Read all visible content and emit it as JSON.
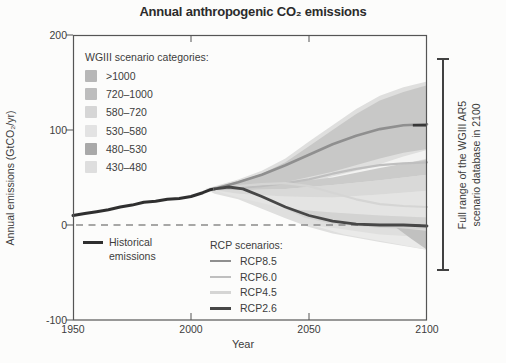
{
  "chart_data": {
    "type": "line",
    "title": "Annual anthropogenic CO₂ emissions",
    "xlabel": "Year",
    "ylabel": "Annual emissions (GtCO₂/yr)",
    "xlim": [
      1950,
      2100
    ],
    "ylim": [
      -100,
      200
    ],
    "xticks": [
      1950,
      2000,
      2050,
      2100
    ],
    "yticks": [
      200,
      100,
      0,
      -100
    ],
    "zero_line": {
      "shown": true,
      "color": "#8a8a8a"
    },
    "axis_color": "#555555",
    "bands": [
      {
        "name": "full-range-fan",
        "color": "#dfdfde",
        "points": [
          [
            2006,
            38
          ],
          [
            2020,
            48
          ],
          [
            2030,
            57
          ],
          [
            2040,
            70
          ],
          [
            2050,
            88
          ],
          [
            2060,
            105
          ],
          [
            2070,
            122
          ],
          [
            2080,
            136
          ],
          [
            2090,
            145
          ],
          [
            2100,
            151
          ],
          [
            2100,
            -26
          ],
          [
            2080,
            -18
          ],
          [
            2060,
            -9
          ],
          [
            2050,
            -2
          ],
          [
            2040,
            7
          ],
          [
            2030,
            17
          ],
          [
            2020,
            27
          ],
          [
            2010,
            33
          ]
        ]
      },
      {
        "name": "upper-high-band",
        "color": "#c8c8c7",
        "points": [
          [
            2008,
            39
          ],
          [
            2020,
            46
          ],
          [
            2030,
            54
          ],
          [
            2040,
            66
          ],
          [
            2050,
            83
          ],
          [
            2060,
            100
          ],
          [
            2070,
            117
          ],
          [
            2080,
            131
          ],
          [
            2090,
            140
          ],
          [
            2100,
            147
          ],
          [
            2100,
            80
          ],
          [
            2090,
            76
          ],
          [
            2080,
            70
          ],
          [
            2060,
            56
          ],
          [
            2040,
            45
          ],
          [
            2020,
            40
          ]
        ]
      },
      {
        "name": "white-sliver",
        "color": "#f3f3f2",
        "points": [
          [
            2058,
            50
          ],
          [
            2075,
            60
          ],
          [
            2090,
            72
          ],
          [
            2100,
            79
          ],
          [
            2100,
            70
          ],
          [
            2090,
            64
          ],
          [
            2075,
            54
          ],
          [
            2060,
            47
          ]
        ]
      },
      {
        "name": "mid-band-rcp60",
        "color": "#cbcbca",
        "points": [
          [
            2008,
            38
          ],
          [
            2020,
            40
          ],
          [
            2040,
            44
          ],
          [
            2060,
            50
          ],
          [
            2080,
            60
          ],
          [
            2100,
            69
          ],
          [
            2100,
            53
          ],
          [
            2080,
            47
          ],
          [
            2060,
            42
          ],
          [
            2040,
            38
          ],
          [
            2020,
            36.5
          ]
        ]
      },
      {
        "name": "mid-band-lower",
        "color": "#d9d9d8",
        "points": [
          [
            2010,
            37
          ],
          [
            2020,
            36.5
          ],
          [
            2040,
            38
          ],
          [
            2060,
            42
          ],
          [
            2080,
            47
          ],
          [
            2100,
            53
          ],
          [
            2100,
            36
          ],
          [
            2080,
            32
          ],
          [
            2060,
            29
          ],
          [
            2040,
            30
          ],
          [
            2020,
            33
          ]
        ]
      },
      {
        "name": "low-band-rcp45",
        "color": "#e4e4e3",
        "points": [
          [
            2010,
            36
          ],
          [
            2020,
            33
          ],
          [
            2040,
            30
          ],
          [
            2060,
            29
          ],
          [
            2080,
            32
          ],
          [
            2100,
            36
          ],
          [
            2100,
            8
          ],
          [
            2080,
            10
          ],
          [
            2060,
            13
          ],
          [
            2040,
            17
          ],
          [
            2030,
            23
          ],
          [
            2020,
            29
          ]
        ]
      },
      {
        "name": "low-band-rcp26",
        "color": "#d3d3d2",
        "points": [
          [
            2040,
            17
          ],
          [
            2060,
            13
          ],
          [
            2080,
            10
          ],
          [
            2100,
            8
          ],
          [
            2100,
            -5
          ],
          [
            2080,
            -3
          ],
          [
            2060,
            1
          ],
          [
            2048,
            8
          ]
        ]
      },
      {
        "name": "below-zero-band",
        "color": "#eaeae9",
        "points": [
          [
            2050,
            0
          ],
          [
            2060,
            -3
          ],
          [
            2080,
            -10
          ],
          [
            2100,
            -13
          ],
          [
            2100,
            -26
          ],
          [
            2085,
            -19
          ],
          [
            2065,
            -10
          ],
          [
            2055,
            -3
          ]
        ]
      },
      {
        "name": "corner-dark-patch",
        "color": "#c1c1c0",
        "points": [
          [
            2087,
            -3
          ],
          [
            2100,
            -6
          ],
          [
            2100,
            -26
          ],
          [
            2093,
            -14
          ]
        ]
      }
    ],
    "series": [
      {
        "name": "Historical emissions",
        "color": "#2f2f2f",
        "width": 3,
        "points": [
          [
            1950,
            10
          ],
          [
            1955,
            12
          ],
          [
            1960,
            14
          ],
          [
            1965,
            16
          ],
          [
            1970,
            19
          ],
          [
            1975,
            21
          ],
          [
            1980,
            24
          ],
          [
            1985,
            25
          ],
          [
            1990,
            27
          ],
          [
            1995,
            28
          ],
          [
            2000,
            30
          ],
          [
            2005,
            34
          ],
          [
            2008,
            37
          ],
          [
            2010,
            38
          ]
        ]
      },
      {
        "name": "RCP8.5",
        "color": "#8f8f8f",
        "width": 2.6,
        "points": [
          [
            2010,
            38
          ],
          [
            2020,
            45
          ],
          [
            2030,
            53
          ],
          [
            2040,
            63
          ],
          [
            2050,
            74
          ],
          [
            2060,
            85
          ],
          [
            2070,
            94
          ],
          [
            2080,
            101
          ],
          [
            2090,
            105
          ],
          [
            2100,
            106
          ]
        ]
      },
      {
        "name": "RCP6.0",
        "color": "#bfbfbf",
        "width": 2.2,
        "points": [
          [
            2010,
            38
          ],
          [
            2020,
            39
          ],
          [
            2030,
            41
          ],
          [
            2040,
            44
          ],
          [
            2050,
            48
          ],
          [
            2060,
            54
          ],
          [
            2070,
            59
          ],
          [
            2080,
            63
          ],
          [
            2090,
            65
          ],
          [
            2100,
            66
          ]
        ]
      },
      {
        "name": "RCP4.5",
        "color": "#d5d5d4",
        "width": 2.2,
        "points": [
          [
            2010,
            38
          ],
          [
            2020,
            41
          ],
          [
            2030,
            43
          ],
          [
            2040,
            44
          ],
          [
            2050,
            41
          ],
          [
            2060,
            34
          ],
          [
            2070,
            27
          ],
          [
            2080,
            22
          ],
          [
            2090,
            20
          ],
          [
            2100,
            19
          ]
        ]
      },
      {
        "name": "RCP2.6",
        "color": "#474747",
        "width": 2.8,
        "points": [
          [
            2010,
            38
          ],
          [
            2016,
            40
          ],
          [
            2022,
            38
          ],
          [
            2030,
            30
          ],
          [
            2040,
            19
          ],
          [
            2050,
            10
          ],
          [
            2060,
            4
          ],
          [
            2070,
            1
          ],
          [
            2080,
            0
          ],
          [
            2090,
            0
          ],
          [
            2100,
            -1
          ]
        ]
      }
    ],
    "end_dash": {
      "value": 105,
      "year_start": 2094,
      "year_end": 2100,
      "color": "#383838"
    }
  },
  "legends": {
    "wgiii": {
      "title": "WGIII scenario categories:",
      "items": [
        {
          "label": ">1000",
          "color": "#b7b7b7"
        },
        {
          "label": "720–1000",
          "color": "#bdbdbd"
        },
        {
          "label": "580–720",
          "color": "#d6d6d6"
        },
        {
          "label": "530–580",
          "color": "#e3e3e3"
        },
        {
          "label": "480–530",
          "color": "#a9a9a9"
        },
        {
          "label": "430–480",
          "color": "#dedede"
        }
      ]
    },
    "historical": {
      "line1": "Historical",
      "line2": "emissions",
      "color": "#2f2f2f"
    },
    "rcp": {
      "title": "RCP scenarios:",
      "items": [
        {
          "label": "RCP8.5",
          "color": "#8f8f8f",
          "width": 2.6
        },
        {
          "label": "RCP6.0",
          "color": "#bfbfbf",
          "width": 2.2
        },
        {
          "label": "RCP4.5",
          "color": "#d5d5d4",
          "width": 2.2
        },
        {
          "label": "RCP2.6",
          "color": "#474747",
          "width": 3
        }
      ]
    }
  },
  "annotations": {
    "right_bracket": {
      "line1": "Full range of the WGIII AR5",
      "line2": "scenario database in 2100"
    }
  }
}
